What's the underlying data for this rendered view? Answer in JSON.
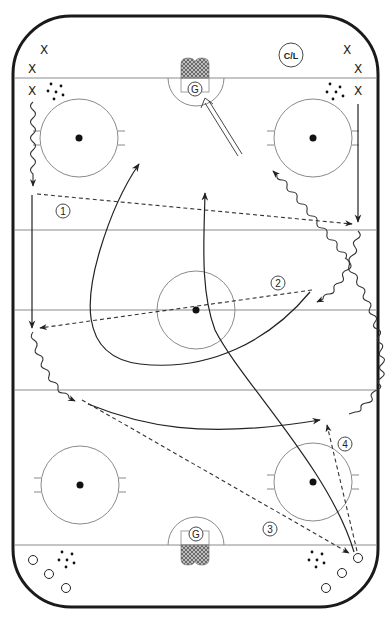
{
  "diagram": {
    "type": "hockey-drill",
    "coach_label": "C/L",
    "goalie_label": "G",
    "team_x_marker": "X",
    "team_o_marker": "O",
    "step_labels": [
      "1",
      "2",
      "3",
      "4"
    ],
    "colors": {
      "boards": "#1a1a1a",
      "lines": "#8a8a8a",
      "paths": "#222222",
      "net": "#555555"
    }
  }
}
